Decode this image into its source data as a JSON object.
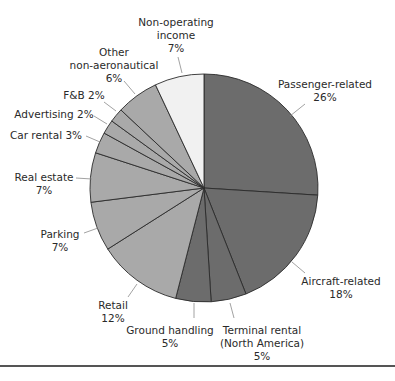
{
  "chart_data": {
    "type": "pie",
    "title": "",
    "start_angle_deg": 0,
    "direction": "clockwise",
    "center": [
      204,
      188
    ],
    "radius": 114,
    "slices": [
      {
        "label": "Passenger-related",
        "value": 26,
        "color": "#6c6c6c",
        "label_lines": [
          "Passenger-related",
          "26%"
        ],
        "anchor": "middle",
        "lx": 325,
        "ly": 88,
        "leader": [
          [
            305,
            104
          ],
          [
            290,
            116
          ]
        ]
      },
      {
        "label": "Aircraft-related",
        "value": 18,
        "color": "#6c6c6c",
        "label_lines": [
          "Aircraft-related",
          "18%"
        ],
        "anchor": "middle",
        "lx": 341,
        "ly": 285,
        "leader": [
          [
            305,
            273
          ],
          [
            292,
            262
          ]
        ]
      },
      {
        "label": "Terminal rental (North America)",
        "value": 5,
        "color": "#6c6c6c",
        "label_lines": [
          "Terminal rental",
          "(North America)",
          "5%"
        ],
        "anchor": "middle",
        "lx": 262,
        "ly": 334,
        "leader": [
          [
            234,
            318
          ],
          [
            230,
            303
          ]
        ]
      },
      {
        "label": "Ground handling",
        "value": 5,
        "color": "#6c6c6c",
        "label_lines": [
          "Ground handling",
          "5%"
        ],
        "anchor": "middle",
        "lx": 170,
        "ly": 334,
        "leader": [
          [
            194,
            318
          ],
          [
            194,
            303
          ]
        ]
      },
      {
        "label": "Retail",
        "value": 12,
        "color": "#a9a9a9",
        "label_lines": [
          "Retail",
          "12%"
        ],
        "anchor": "middle",
        "lx": 113,
        "ly": 309,
        "leader": [
          [
            128,
            297
          ],
          [
            137,
            284
          ]
        ]
      },
      {
        "label": "Parking",
        "value": 7,
        "color": "#a9a9a9",
        "label_lines": [
          "Parking",
          "7%"
        ],
        "anchor": "middle",
        "lx": 60,
        "ly": 238,
        "leader": [
          [
            84,
            233
          ],
          [
            98,
            228
          ]
        ]
      },
      {
        "label": "Real estate",
        "value": 7,
        "color": "#a9a9a9",
        "label_lines": [
          "Real estate",
          "7%"
        ],
        "anchor": "middle",
        "lx": 44,
        "ly": 181,
        "leader": [
          [
            76,
            178
          ],
          [
            92,
            179
          ]
        ]
      },
      {
        "label": "Car rental",
        "value": 3,
        "color": "#a9a9a9",
        "label_lines": [
          "Car rental 3%"
        ],
        "anchor": "middle",
        "lx": 46,
        "ly": 139,
        "leader": [
          [
            86,
            136
          ],
          [
            100,
            142
          ]
        ]
      },
      {
        "label": "Advertising",
        "value": 2,
        "color": "#a9a9a9",
        "label_lines": [
          "Advertising 2%"
        ],
        "anchor": "middle",
        "lx": 54,
        "ly": 118,
        "leader": [
          [
            94,
            116
          ],
          [
            107,
            124
          ]
        ]
      },
      {
        "label": "F&B",
        "value": 2,
        "color": "#a9a9a9",
        "label_lines": [
          "F&B 2%"
        ],
        "anchor": "middle",
        "lx": 84,
        "ly": 99,
        "leader": [
          [
            104,
            102
          ],
          [
            116,
            111
          ]
        ]
      },
      {
        "label": "Other non-aeronautical",
        "value": 6,
        "color": "#a9a9a9",
        "label_lines": [
          "Other",
          "non-aeronautical",
          "6%"
        ],
        "anchor": "middle",
        "lx": 114,
        "ly": 56,
        "leader": [
          [
            124,
            81
          ],
          [
            135,
            94
          ]
        ]
      },
      {
        "label": "Non-operating income",
        "value": 7,
        "color": "#f1f1f1",
        "label_lines": [
          "Non-operating",
          "income",
          "7%"
        ],
        "anchor": "middle",
        "lx": 176,
        "ly": 26,
        "leader": [
          [
            178,
            57
          ],
          [
            182,
            73
          ]
        ]
      }
    ]
  }
}
